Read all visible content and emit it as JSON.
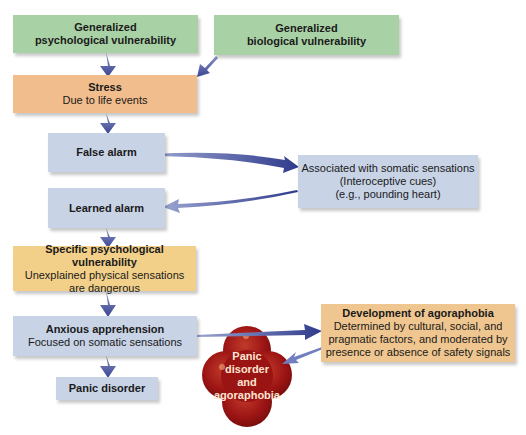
{
  "diagram": {
    "nodes": {
      "gen_psych": {
        "title": "Generalized",
        "title2": "psychological vulnerability"
      },
      "gen_bio": {
        "title": "Generalized",
        "title2": "biological vulnerability"
      },
      "stress": {
        "title": "Stress",
        "subtitle": "Due to life events"
      },
      "false_alarm": {
        "title": "False alarm"
      },
      "somatic": {
        "line1": "Associated with somatic sensations",
        "line2": "(Interoceptive cues)",
        "line3": "(e.g., pounding heart)"
      },
      "learned_alarm": {
        "title": "Learned alarm"
      },
      "specific_psych": {
        "title": "Specific psychological vulnerability",
        "line1": "Unexplained physical sensations",
        "line2": "are dangerous"
      },
      "anxious": {
        "title": "Anxious apprehension",
        "subtitle": "Focused on somatic sensations"
      },
      "panic_disorder": {
        "title": "Panic disorder"
      },
      "agoraphobia": {
        "title": "Development of agoraphobia",
        "line1": "Determined by cultural, social, and",
        "line2": "pragmatic factors, and moderated by",
        "line3": "presence or absence of safety signals"
      },
      "outcome": {
        "line1": "Panic",
        "line2": "disorder",
        "line3": "and",
        "line4": "agoraphobia"
      }
    },
    "edges": [
      {
        "from": "gen_psych",
        "to": "stress"
      },
      {
        "from": "gen_bio",
        "to": "stress"
      },
      {
        "from": "stress",
        "to": "false_alarm"
      },
      {
        "from": "false_alarm",
        "to": "somatic"
      },
      {
        "from": "somatic",
        "to": "learned_alarm"
      },
      {
        "from": "learned_alarm",
        "to": "specific_psych"
      },
      {
        "from": "specific_psych",
        "to": "anxious"
      },
      {
        "from": "anxious",
        "to": "panic_disorder"
      },
      {
        "from": "anxious",
        "to": "agoraphobia"
      },
      {
        "from": "agoraphobia",
        "to": "outcome"
      }
    ],
    "colors": {
      "green": "#a9d1a6",
      "orange": "#f1bd8d",
      "blue": "#c8d3e6",
      "yellow": "#f2d08a",
      "tan": "#efc690",
      "arrow": "#3e4a96",
      "cloud": "#9b1414"
    }
  }
}
